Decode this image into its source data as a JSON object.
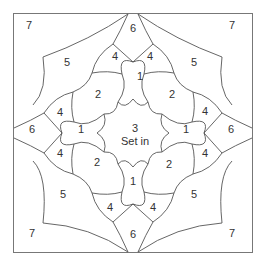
{
  "diagram": {
    "center": {
      "number": "3",
      "note": "Set in"
    },
    "labels": {
      "tl7": "7",
      "tr7": "7",
      "bl7": "7",
      "br7": "7",
      "t6": "6",
      "b6": "6",
      "l6": "6",
      "r6": "6",
      "tl5": "5",
      "tr5": "5",
      "bl5": "5",
      "br5": "5",
      "t4a": "4",
      "t4b": "4",
      "b4a": "4",
      "b4b": "4",
      "l4a": "4",
      "l4b": "4",
      "r4a": "4",
      "r4b": "4",
      "t1": "1",
      "b1": "1",
      "l1": "1",
      "r1": "1",
      "tl2": "2",
      "tr2": "2",
      "bl2": "2",
      "br2": "2"
    }
  }
}
